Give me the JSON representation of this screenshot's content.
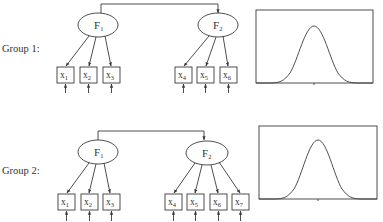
{
  "groups": [
    {
      "label": "Group 1:",
      "factors": [
        {
          "name": "F",
          "sub": "1"
        },
        {
          "name": "F",
          "sub": "2"
        }
      ],
      "indicators": [
        {
          "name": "x",
          "sub": "1",
          "factor": 1
        },
        {
          "name": "x",
          "sub": "2",
          "factor": 1
        },
        {
          "name": "x",
          "sub": "3",
          "factor": 1
        },
        {
          "name": "x",
          "sub": "4",
          "factor": 2
        },
        {
          "name": "x",
          "sub": "5",
          "factor": 2
        },
        {
          "name": "x",
          "sub": "6",
          "factor": 2
        }
      ],
      "distribution": "normal"
    },
    {
      "label": "Group 2:",
      "factors": [
        {
          "name": "F",
          "sub": "1"
        },
        {
          "name": "F",
          "sub": "2"
        }
      ],
      "indicators": [
        {
          "name": "x",
          "sub": "1",
          "factor": 1
        },
        {
          "name": "x",
          "sub": "2",
          "factor": 1
        },
        {
          "name": "x",
          "sub": "3",
          "factor": 1
        },
        {
          "name": "x",
          "sub": "4",
          "factor": 2
        },
        {
          "name": "x",
          "sub": "5",
          "factor": 2
        },
        {
          "name": "x",
          "sub": "6",
          "factor": 2
        },
        {
          "name": "x",
          "sub": "7",
          "factor": 2
        }
      ],
      "distribution": "normal"
    }
  ],
  "colors": {
    "line": "#3a3a3a",
    "text": "#333333",
    "background": "#ffffff"
  }
}
